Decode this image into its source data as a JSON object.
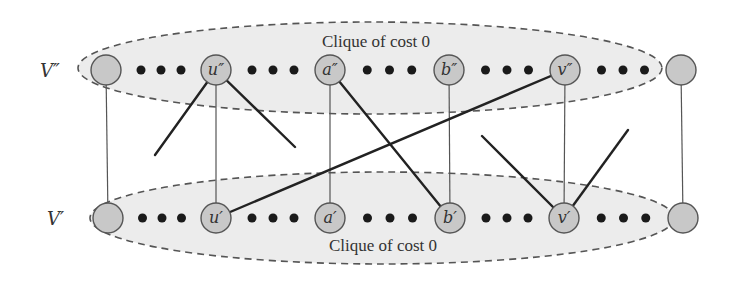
{
  "diagram": {
    "type": "bipartite-clique-reduction",
    "sets": [
      {
        "id": "V2",
        "label": "V″",
        "clique_label": "Clique of cost 0",
        "row_y": 70
      },
      {
        "id": "V1",
        "label": "V′",
        "clique_label": "Clique of cost 0",
        "row_y": 218
      }
    ],
    "top_nodes": [
      {
        "id": "t0",
        "label": "",
        "x": 106
      },
      {
        "id": "u2",
        "label": "u″",
        "x": 216
      },
      {
        "id": "a2",
        "label": "a″",
        "x": 330
      },
      {
        "id": "b2",
        "label": "b″",
        "x": 449
      },
      {
        "id": "v2",
        "label": "v″",
        "x": 565
      },
      {
        "id": "t5",
        "label": "",
        "x": 681
      }
    ],
    "bottom_nodes": [
      {
        "id": "b0",
        "label": "",
        "x": 108
      },
      {
        "id": "u1",
        "label": "u′",
        "x": 216
      },
      {
        "id": "a1",
        "label": "a′",
        "x": 330
      },
      {
        "id": "b1",
        "label": "b′",
        "x": 450
      },
      {
        "id": "v1",
        "label": "v′",
        "x": 564
      },
      {
        "id": "b5",
        "label": "",
        "x": 683
      }
    ],
    "edges": [
      {
        "from": "t0",
        "to": "b0",
        "style": "thin"
      },
      {
        "from": "u2",
        "to": "u1",
        "style": "thin"
      },
      {
        "from": "a2",
        "to": "a1",
        "style": "thin"
      },
      {
        "from": "b2",
        "to": "b1",
        "style": "thin"
      },
      {
        "from": "v2",
        "to": "v1",
        "style": "thin"
      },
      {
        "from": "t5",
        "to": "b5",
        "style": "thin"
      },
      {
        "from": "a2",
        "to": "b1",
        "style": "thick"
      },
      {
        "from": "u1",
        "to": "v2",
        "style": "thick"
      },
      {
        "from": "u2",
        "to": "dangling",
        "style": "thick",
        "end": [
          155,
          155
        ]
      },
      {
        "from": "u2",
        "to": "dangling",
        "style": "thick",
        "end": [
          295,
          147
        ]
      },
      {
        "from": "v1",
        "to": "dangling",
        "style": "thick",
        "end": [
          482,
          136
        ]
      },
      {
        "from": "v1",
        "to": "dangling",
        "style": "thick",
        "end": [
          628,
          130
        ]
      }
    ],
    "ellipsis_dots_per_gap": 3
  }
}
